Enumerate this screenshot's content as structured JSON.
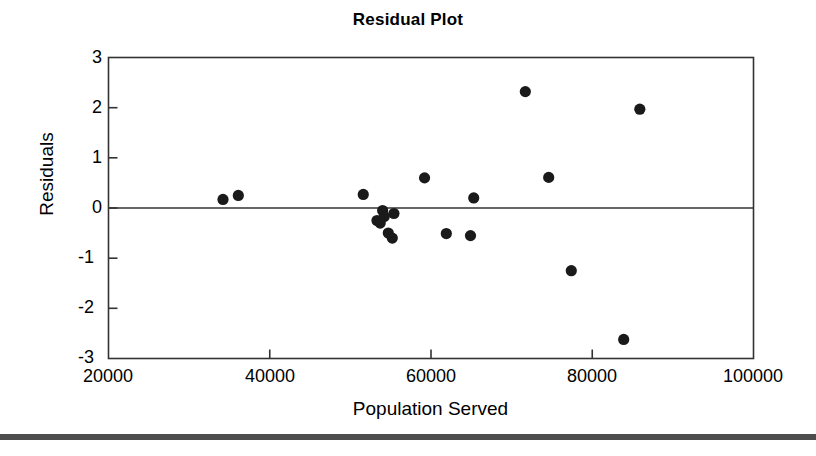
{
  "chart_data": {
    "type": "scatter",
    "title": "Residual Plot",
    "xlabel": "Population Served",
    "ylabel": "Residuals",
    "xlim": [
      20000,
      100000
    ],
    "ylim": [
      -3,
      3
    ],
    "xticks": [
      20000,
      40000,
      60000,
      80000,
      100000
    ],
    "xtick_labels": [
      "20000",
      "40000",
      "60000",
      "80000",
      "100000"
    ],
    "yticks": [
      -3,
      -2,
      -1,
      0,
      1,
      2,
      3
    ],
    "ytick_labels": [
      "-3",
      "-2",
      "-1",
      "0",
      "1",
      "2",
      "3"
    ],
    "grid": false,
    "legend": null,
    "reference_line": {
      "orientation": "horizontal",
      "y": 0,
      "color": "#000000"
    },
    "marker": {
      "shape": "circle",
      "color": "#1a1a1a",
      "size": 9
    },
    "points": [
      {
        "x": 34200,
        "y": 0.17
      },
      {
        "x": 36100,
        "y": 0.25
      },
      {
        "x": 51600,
        "y": 0.27
      },
      {
        "x": 53300,
        "y": -0.25
      },
      {
        "x": 53700,
        "y": -0.3
      },
      {
        "x": 54000,
        "y": -0.05
      },
      {
        "x": 54200,
        "y": -0.17
      },
      {
        "x": 54700,
        "y": -0.5
      },
      {
        "x": 55200,
        "y": -0.6
      },
      {
        "x": 55400,
        "y": -0.11
      },
      {
        "x": 59200,
        "y": 0.6
      },
      {
        "x": 61900,
        "y": -0.51
      },
      {
        "x": 64900,
        "y": -0.55
      },
      {
        "x": 65300,
        "y": 0.2
      },
      {
        "x": 71700,
        "y": 2.32
      },
      {
        "x": 74600,
        "y": 0.61
      },
      {
        "x": 77400,
        "y": -1.25
      },
      {
        "x": 83900,
        "y": -2.62
      },
      {
        "x": 85900,
        "y": 1.97
      }
    ]
  },
  "axes": {
    "title": "Residual Plot",
    "ylabel": "Residuals",
    "xlabel": "Population Served"
  },
  "colors": {
    "marker": "#1a1a1a",
    "axis": "#333333",
    "text": "#000000",
    "background": "#ffffff",
    "footer_strip": "#4d4d4d"
  }
}
